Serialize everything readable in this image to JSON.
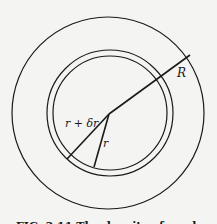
{
  "diagram": {
    "type": "concentric-circles",
    "labels": {
      "outer_radius": "R",
      "shell_outer_radius": "r + δr",
      "shell_inner_radius": "r"
    },
    "caption": "FIG. 3.11 The density of a sphere of radius R"
  }
}
